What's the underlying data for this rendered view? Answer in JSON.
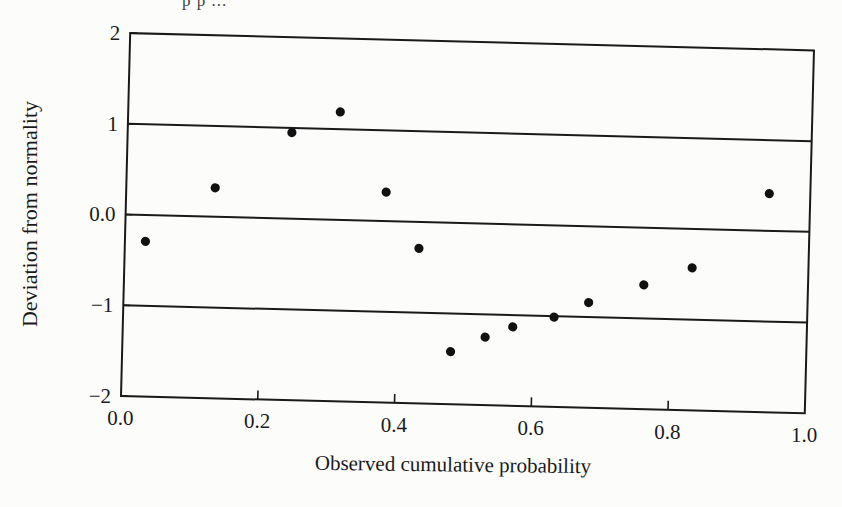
{
  "page": {
    "top_fragment": "p  p  ... "
  },
  "chart_data": {
    "type": "scatter",
    "title": "",
    "xlabel": "Observed cumulative probability",
    "ylabel": "Deviation from normality",
    "xlim": [
      0.0,
      1.0
    ],
    "ylim": [
      -2,
      2
    ],
    "x_ticks": [
      "0.0",
      "0.2",
      "0.4",
      "0.6",
      "0.8",
      "1.0"
    ],
    "y_ticks": [
      "2",
      "1",
      "0.0",
      "−1",
      "−2"
    ],
    "reference_lines": [
      1,
      0,
      -1
    ],
    "grid": false,
    "legend": null,
    "marker": "filled-circle",
    "marker_color": "#111111",
    "points": [
      {
        "x": 0.03,
        "y": -0.29
      },
      {
        "x": 0.13,
        "y": 0.32
      },
      {
        "x": 0.24,
        "y": 0.95
      },
      {
        "x": 0.31,
        "y": 1.19
      },
      {
        "x": 0.38,
        "y": 0.32
      },
      {
        "x": 0.43,
        "y": -0.29
      },
      {
        "x": 0.48,
        "y": -1.42
      },
      {
        "x": 0.53,
        "y": -1.25
      },
      {
        "x": 0.57,
        "y": -1.13
      },
      {
        "x": 0.63,
        "y": -1.01
      },
      {
        "x": 0.68,
        "y": -0.84
      },
      {
        "x": 0.76,
        "y": -0.63
      },
      {
        "x": 0.83,
        "y": -0.43
      },
      {
        "x": 0.94,
        "y": 0.41
      }
    ]
  }
}
